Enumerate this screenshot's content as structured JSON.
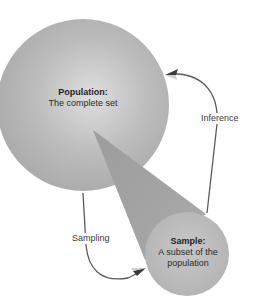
{
  "diagram": {
    "type": "sampling-inference-cycle",
    "population": {
      "title": "Population:",
      "description": "The complete set"
    },
    "sample": {
      "title": "Sample:",
      "description_line1": "A subset of the",
      "description_line2": "population"
    },
    "edges": [
      {
        "from": "population",
        "to": "sample",
        "label": "Sampling"
      },
      {
        "from": "sample",
        "to": "population",
        "label": "Inference"
      }
    ],
    "colors": {
      "population_fill": "#b4b4b4",
      "population_highlight": "#dcdcdc",
      "sample_fill": "#bdbdbd",
      "cone_fill": "#a3a3a3",
      "arrow_stroke": "#555555",
      "arrowhead": "#3a3a3a",
      "text": "#2a2a2a"
    }
  }
}
